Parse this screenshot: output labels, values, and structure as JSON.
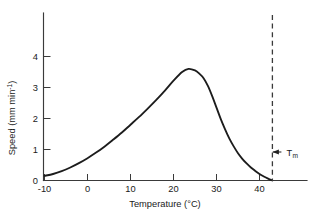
{
  "figure": {
    "background_color": "#ffffff",
    "curve_color": "#1c1c1c",
    "axis_color": "#3a3a3a"
  },
  "chart_data": {
    "type": "line",
    "title": "",
    "subtitle": "",
    "xlabel": "Temperature (°C)",
    "ylabel": "Speed (mm min",
    "ylabel_exponent": "-1",
    "ylabel_close": ")",
    "xlim": [
      -12,
      49
    ],
    "ylim": [
      0,
      4.6
    ],
    "xticks": [
      -10,
      0,
      10,
      20,
      30,
      40
    ],
    "xtick_labels": [
      "-10",
      "0",
      "10",
      "20",
      "30",
      "40"
    ],
    "yticks": [
      0,
      1,
      2,
      3,
      4
    ],
    "ytick_labels": [
      "0",
      "1",
      "2",
      "3",
      "4"
    ],
    "grid": false,
    "legend": false,
    "legend_position": "none",
    "x": [
      -10,
      -8,
      -6,
      -4,
      -2,
      0,
      2,
      4,
      6,
      8,
      10,
      12,
      14,
      16,
      18,
      20,
      22,
      23.5,
      25,
      26,
      27,
      28,
      29,
      30,
      31,
      32,
      33,
      34,
      35,
      36,
      37,
      38,
      39,
      40,
      41,
      42,
      43
    ],
    "y": [
      0.15,
      0.21,
      0.3,
      0.42,
      0.56,
      0.72,
      0.9,
      1.1,
      1.32,
      1.55,
      1.8,
      2.05,
      2.32,
      2.6,
      2.9,
      3.22,
      3.5,
      3.6,
      3.55,
      3.45,
      3.3,
      3.05,
      2.72,
      2.35,
      1.98,
      1.65,
      1.35,
      1.1,
      0.88,
      0.7,
      0.55,
      0.42,
      0.31,
      0.21,
      0.13,
      0.06,
      0.0
    ],
    "peak": {
      "x": 23.5,
      "y": 3.6
    },
    "annotations": [
      {
        "name": "t-max-threshold",
        "label": "T",
        "sublabel": "m",
        "value_x": 43,
        "style": "dashed-vertical-with-left-arrow"
      }
    ]
  }
}
